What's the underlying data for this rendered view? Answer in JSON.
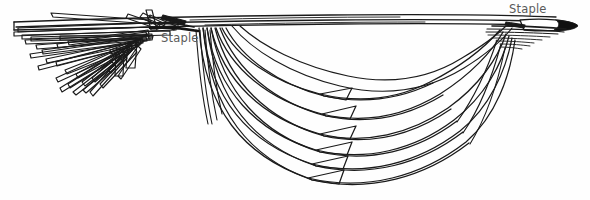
{
  "image": {
    "title": "Stapled strand bundle line drawing",
    "width": 590,
    "height": 200,
    "background_color": "#fefefe",
    "ink_color": "#1a1a1a",
    "label_color": "#5a5a5a",
    "style": "black-and-white technical line illustration"
  },
  "labels": {
    "staple_left": "Staple",
    "staple_right": "Staple"
  },
  "annotations": [
    {
      "name": "staple-left",
      "text": "Staple",
      "x": 161,
      "y": 31,
      "points_to": "left staple crimp on the upper horizontal bundle"
    },
    {
      "name": "staple-right",
      "text": "Staple",
      "x": 509,
      "y": 2,
      "points_to": "right staple crimp at the tapered dark tip"
    }
  ],
  "diagram": {
    "fan_strip_count": 18,
    "loop_count": 7,
    "top_band": {
      "left_x": 12,
      "right_x": 578,
      "y": 22,
      "thickness": 9
    },
    "left_staple_x": 178,
    "right_staple_x": 560,
    "lowest_loop_y": 185
  }
}
